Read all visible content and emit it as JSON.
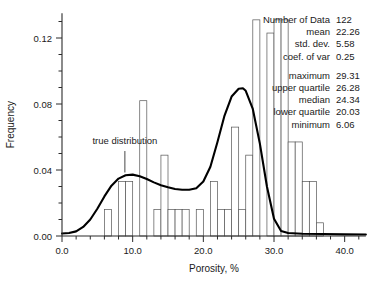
{
  "chart_data": {
    "type": "bar",
    "title": "",
    "xlabel": "Porosity, %",
    "ylabel": "Frequency",
    "xlim": [
      0.0,
      43.0
    ],
    "ylim": [
      0.0,
      0.135
    ],
    "grid": false,
    "legend": "none",
    "x_ticks": [
      0.0,
      10.0,
      20.0,
      30.0,
      40.0
    ],
    "x_tick_labels": [
      "0.0",
      "10.0",
      "20.0",
      "30.0",
      "40.0"
    ],
    "x_minor_step": 2.0,
    "y_ticks": [
      0.0,
      0.04,
      0.08,
      0.12
    ],
    "y_tick_labels": [
      "0.00",
      "0.04",
      "0.08",
      "0.12"
    ],
    "y_minor_step": 0.01,
    "bin_width": 1.0,
    "bins_start": 6.0,
    "bar_values": [
      0.016,
      0.0,
      0.033,
      0.033,
      0.0,
      0.082,
      0.0,
      0.016,
      0.049,
      0.016,
      0.016,
      0.016,
      0.0,
      0.016,
      0.0,
      0.033,
      0.016,
      0.016,
      0.066,
      0.016,
      0.049,
      0.131,
      0.0,
      0.123,
      0.131,
      0.131,
      0.057,
      0.057,
      0.033,
      0.033,
      0.008
    ],
    "curve_label": "true distribution",
    "curve_points": [
      [
        0.0,
        0.0015
      ],
      [
        1.0,
        0.0018
      ],
      [
        2.0,
        0.0028
      ],
      [
        3.0,
        0.0055
      ],
      [
        4.0,
        0.01
      ],
      [
        5.0,
        0.0165
      ],
      [
        6.0,
        0.024
      ],
      [
        7.0,
        0.0305
      ],
      [
        8.0,
        0.0348
      ],
      [
        9.0,
        0.0368
      ],
      [
        10.0,
        0.0372
      ],
      [
        11.0,
        0.0362
      ],
      [
        12.0,
        0.0345
      ],
      [
        13.0,
        0.0325
      ],
      [
        14.0,
        0.0308
      ],
      [
        15.0,
        0.0295
      ],
      [
        16.0,
        0.0285
      ],
      [
        17.0,
        0.028
      ],
      [
        18.0,
        0.028
      ],
      [
        19.0,
        0.029
      ],
      [
        20.0,
        0.033
      ],
      [
        21.0,
        0.042
      ],
      [
        22.0,
        0.057
      ],
      [
        23.0,
        0.073
      ],
      [
        24.0,
        0.0845
      ],
      [
        25.0,
        0.0892
      ],
      [
        25.6,
        0.0895
      ],
      [
        26.0,
        0.088
      ],
      [
        27.0,
        0.077
      ],
      [
        28.0,
        0.056
      ],
      [
        29.0,
        0.03
      ],
      [
        30.0,
        0.0105
      ],
      [
        31.0,
        0.003
      ],
      [
        32.0,
        0.0018
      ],
      [
        34.0,
        0.0014
      ],
      [
        37.0,
        0.0012
      ],
      [
        40.0,
        0.001
      ],
      [
        43.0,
        0.0009
      ]
    ],
    "annotation": {
      "text": "true distribution",
      "x": 8.9,
      "y": 0.0555,
      "leader_x": 8.9,
      "leader_y_top": 0.0515,
      "leader_y_bottom": 0.0385
    }
  },
  "stats": {
    "rows": [
      {
        "label": "Number of Data",
        "value": "122"
      },
      {
        "label": "mean",
        "value": "22.26"
      },
      {
        "label": "std. dev.",
        "value": "5.58"
      },
      {
        "label": "coef. of var",
        "value": "0.25"
      },
      {
        "label": "maximum",
        "value": "29.31"
      },
      {
        "label": "upper quartile",
        "value": "26.28"
      },
      {
        "label": "median",
        "value": "24.34"
      },
      {
        "label": "lower quartile",
        "value": "20.03"
      },
      {
        "label": "minimum",
        "value": "6.06"
      }
    ],
    "group_break_after_index": 3
  }
}
